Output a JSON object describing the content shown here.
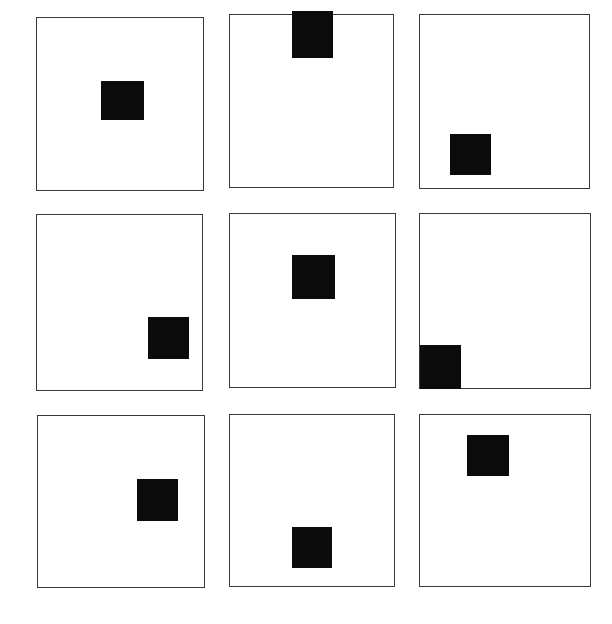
{
  "figure": {
    "background_color": "#ffffff",
    "frame_color": "#3a3a3a",
    "marker_color": "#0b0b0b",
    "canvas": {
      "width": 612,
      "height": 624
    },
    "grid": {
      "rows": 3,
      "columns": 3,
      "total_panels": 9
    }
  },
  "panels": [
    {
      "id": "panel-1",
      "row": 1,
      "column": 1,
      "frame": {
        "x": 36,
        "y": 17,
        "width": 168,
        "height": 174
      },
      "marker": {
        "x": 64,
        "y": 63,
        "width": 43,
        "height": 39,
        "position_label": "center",
        "touches_edge": "none"
      }
    },
    {
      "id": "panel-2",
      "row": 1,
      "column": 2,
      "frame": {
        "x": 229,
        "y": 14,
        "width": 165,
        "height": 174
      },
      "marker": {
        "x": 62,
        "y": -4,
        "width": 41,
        "height": 47,
        "position_label": "top-center",
        "touches_edge": "top"
      }
    },
    {
      "id": "panel-3",
      "row": 1,
      "column": 3,
      "frame": {
        "x": 419,
        "y": 14,
        "width": 171,
        "height": 175
      },
      "marker": {
        "x": 30,
        "y": 119,
        "width": 41,
        "height": 41,
        "position_label": "lower-left",
        "touches_edge": "none"
      }
    },
    {
      "id": "panel-4",
      "row": 2,
      "column": 1,
      "frame": {
        "x": 36,
        "y": 214,
        "width": 167,
        "height": 177
      },
      "marker": {
        "x": 111,
        "y": 102,
        "width": 41,
        "height": 42,
        "position_label": "lower-right",
        "touches_edge": "none"
      }
    },
    {
      "id": "panel-5",
      "row": 2,
      "column": 2,
      "frame": {
        "x": 229,
        "y": 213,
        "width": 167,
        "height": 175
      },
      "marker": {
        "x": 62,
        "y": 41,
        "width": 43,
        "height": 44,
        "position_label": "upper-center",
        "touches_edge": "none"
      }
    },
    {
      "id": "panel-6",
      "row": 2,
      "column": 3,
      "frame": {
        "x": 419,
        "y": 213,
        "width": 172,
        "height": 176
      },
      "marker": {
        "x": 0,
        "y": 131,
        "width": 41,
        "height": 44,
        "position_label": "bottom-left-corner",
        "touches_edge": "left-and-bottom"
      }
    },
    {
      "id": "panel-7",
      "row": 3,
      "column": 1,
      "frame": {
        "x": 37,
        "y": 415,
        "width": 168,
        "height": 173
      },
      "marker": {
        "x": 99,
        "y": 63,
        "width": 41,
        "height": 42,
        "position_label": "center-right",
        "touches_edge": "none"
      }
    },
    {
      "id": "panel-8",
      "row": 3,
      "column": 2,
      "frame": {
        "x": 229,
        "y": 414,
        "width": 166,
        "height": 173
      },
      "marker": {
        "x": 62,
        "y": 112,
        "width": 40,
        "height": 41,
        "position_label": "lower-center",
        "touches_edge": "none"
      }
    },
    {
      "id": "panel-9",
      "row": 3,
      "column": 3,
      "frame": {
        "x": 419,
        "y": 414,
        "width": 172,
        "height": 173
      },
      "marker": {
        "x": 47,
        "y": 20,
        "width": 42,
        "height": 41,
        "position_label": "upper-center-left",
        "touches_edge": "none"
      }
    }
  ]
}
